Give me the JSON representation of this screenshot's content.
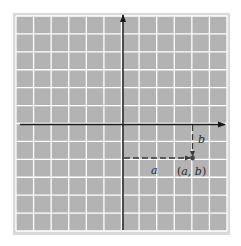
{
  "diagram": {
    "type": "coordinate-plane",
    "grid": {
      "columns": 12,
      "rows": 12,
      "background": "#b3b3b3",
      "line_color": "#ffffff",
      "frame_color": "#d9d9d9"
    },
    "axes": {
      "color": "#1a1a1a",
      "x_axis_arrow": "right",
      "y_axis_arrow": "up"
    },
    "point": {
      "label_open": "(",
      "label_a": "a",
      "label_sep": ", ",
      "label_b": "b",
      "label_close": ")",
      "grid_x": 4,
      "grid_y": -2,
      "color": "#444444"
    },
    "labels": {
      "horizontal_distance": "a",
      "vertical_distance": "b"
    },
    "dash_color": "#3a3a3a"
  }
}
